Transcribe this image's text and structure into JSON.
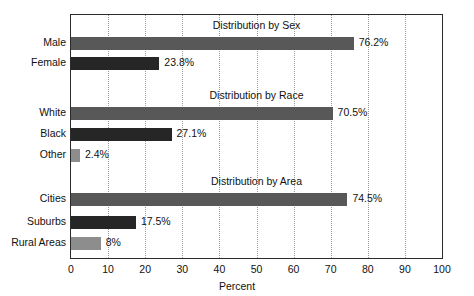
{
  "chart_data": {
    "type": "bar",
    "orientation": "horizontal",
    "title": "",
    "xlabel": "Percent",
    "ylabel": "",
    "xlim": [
      0,
      100
    ],
    "xticks": [
      0,
      10,
      20,
      30,
      40,
      50,
      60,
      70,
      80,
      90,
      100
    ],
    "xtick_labels": [
      "0",
      "10",
      "20",
      "30",
      "40",
      "50",
      "60",
      "70",
      "80",
      "90",
      "100"
    ],
    "grid": "vertical-dotted",
    "legend": "none",
    "categories": [
      "Male",
      "Female",
      "White",
      "Black",
      "Other",
      "Cities",
      "Suburbs",
      "Rural Areas"
    ],
    "values": [
      76.2,
      23.8,
      70.5,
      27.1,
      2.4,
      74.5,
      17.5,
      8
    ],
    "value_labels": [
      "76.2%",
      "23.8%",
      "70.5%",
      "27.1%",
      "2.4%",
      "74.5%",
      "17.5%",
      "8%"
    ],
    "annotations": [
      "Distribution by Sex",
      "Distribution by Race",
      "Distribution by Area"
    ],
    "groups": [
      {
        "title": "Distribution by Sex",
        "bars": [
          {
            "label": "Male",
            "value": 76.2,
            "value_label": "76.2%",
            "tone": "mid",
            "color": "#585858"
          },
          {
            "label": "Female",
            "value": 23.8,
            "value_label": "23.8%",
            "tone": "dark",
            "color": "#262626"
          }
        ]
      },
      {
        "title": "Distribution by Race",
        "bars": [
          {
            "label": "White",
            "value": 70.5,
            "value_label": "70.5%",
            "tone": "mid",
            "color": "#585858"
          },
          {
            "label": "Black",
            "value": 27.1,
            "value_label": "27.1%",
            "tone": "dark",
            "color": "#262626"
          },
          {
            "label": "Other",
            "value": 2.4,
            "value_label": "2.4%",
            "tone": "light",
            "color": "#8d8d8d"
          }
        ]
      },
      {
        "title": "Distribution by Area",
        "bars": [
          {
            "label": "Cities",
            "value": 74.5,
            "value_label": "74.5%",
            "tone": "mid",
            "color": "#585858"
          },
          {
            "label": "Suburbs",
            "value": 17.5,
            "value_label": "17.5%",
            "tone": "dark",
            "color": "#262626"
          },
          {
            "label": "Rural Areas",
            "value": 8,
            "value_label": "8%",
            "tone": "light",
            "color": "#8d8d8d"
          }
        ]
      }
    ]
  },
  "axis": {
    "x_title": "Percent",
    "tick_labels": [
      "0",
      "10",
      "20",
      "30",
      "40",
      "50",
      "60",
      "70",
      "80",
      "90",
      "100"
    ]
  },
  "titles": {
    "sex": "Distribution by Sex",
    "race": "Distribution by Race",
    "area": "Distribution by Area"
  },
  "labels": {
    "male": "Male",
    "female": "Female",
    "white": "White",
    "black": "Black",
    "other": "Other",
    "cities": "Cities",
    "suburbs": "Suburbs",
    "rural_areas": "Rural Areas"
  },
  "values": {
    "male": "76.2%",
    "female": "23.8%",
    "white": "70.5%",
    "black": "27.1%",
    "other": "2.4%",
    "cities": "74.5%",
    "suburbs": "17.5%",
    "rural_areas": "8%"
  },
  "colors": {
    "bar_mid": "#585858",
    "bar_dark": "#262626",
    "bar_light": "#8d8d8d",
    "frame": "#2b2b2b",
    "grid": "#9a9a9a",
    "text": "#111111",
    "background": "#ffffff"
  }
}
